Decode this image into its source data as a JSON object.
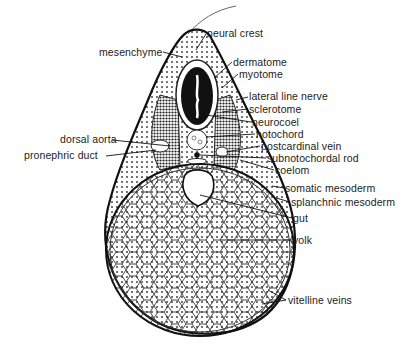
{
  "figure": {
    "labels": {
      "left": [
        {
          "id": "mesenchyme",
          "text": "mesenchyme",
          "x": 99,
          "y": 47
        },
        {
          "id": "dorsal_aorta",
          "text": "dorsal aorta",
          "x": 60,
          "y": 134
        },
        {
          "id": "pronephric_duct",
          "text": "pronephric duct",
          "x": 24,
          "y": 150
        }
      ],
      "right": [
        {
          "id": "neural_crest",
          "text": "neural crest",
          "x": 207,
          "y": 28
        },
        {
          "id": "dermatome",
          "text": "dermatome",
          "x": 233,
          "y": 57
        },
        {
          "id": "myotome",
          "text": "myotome",
          "x": 239,
          "y": 69
        },
        {
          "id": "lateral_line_nerve",
          "text": "lateral line nerve",
          "x": 249,
          "y": 91
        },
        {
          "id": "sclerotome",
          "text": "sclerotome",
          "x": 249,
          "y": 103
        },
        {
          "id": "neurocoel",
          "text": "neurocoel",
          "x": 252,
          "y": 117
        },
        {
          "id": "notochord",
          "text": "notochord",
          "x": 256,
          "y": 129
        },
        {
          "id": "postcardinal_vein",
          "text": "postcardinal vein",
          "x": 261,
          "y": 141
        },
        {
          "id": "subnotochordal_rod",
          "text": "subnotochordal rod",
          "x": 267,
          "y": 153
        },
        {
          "id": "coelom",
          "text": "coelom",
          "x": 275,
          "y": 165
        },
        {
          "id": "somatic_mesoderm",
          "text": "somatic mesoderm",
          "x": 285,
          "y": 183
        },
        {
          "id": "splanchnic_mesoderm",
          "text": "splanchnic mesoderm",
          "x": 291,
          "y": 197
        },
        {
          "id": "gut",
          "text": "gut",
          "x": 293,
          "y": 213
        },
        {
          "id": "yolk",
          "text": "yolk",
          "x": 293,
          "y": 235
        },
        {
          "id": "vitelline_veins",
          "text": "vitelline veins",
          "x": 288,
          "y": 295
        }
      ]
    }
  }
}
